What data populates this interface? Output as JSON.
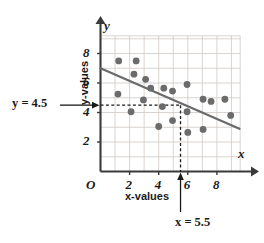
{
  "chart_data": {
    "type": "scatter",
    "title": "",
    "xlabel": "x-values",
    "ylabel": "y-values",
    "axis_letter_x": "x",
    "axis_letter_y": "y",
    "origin_label": "O",
    "xlim": [
      0,
      9.6
    ],
    "ylim": [
      0,
      9.2
    ],
    "xticks": [
      2,
      4,
      6,
      8
    ],
    "yticks": [
      2,
      4,
      6,
      8
    ],
    "xtick_labels": [
      "2",
      "4",
      "6",
      "8"
    ],
    "ytick_labels": [
      "2",
      "4",
      "6",
      "8"
    ],
    "grid": true,
    "grid_step": 1,
    "legend": "none",
    "points": [
      {
        "x": 1.25,
        "y": 7.5
      },
      {
        "x": 2.45,
        "y": 7.5
      },
      {
        "x": 2.3,
        "y": 6.6
      },
      {
        "x": 3.1,
        "y": 6.25
      },
      {
        "x": 1.2,
        "y": 5.25
      },
      {
        "x": 3.45,
        "y": 5.65
      },
      {
        "x": 4.35,
        "y": 5.65
      },
      {
        "x": 4.95,
        "y": 5.45
      },
      {
        "x": 5.95,
        "y": 5.9
      },
      {
        "x": 2.95,
        "y": 4.85
      },
      {
        "x": 4.25,
        "y": 4.4
      },
      {
        "x": 7.05,
        "y": 4.9
      },
      {
        "x": 7.6,
        "y": 4.75
      },
      {
        "x": 8.55,
        "y": 4.9
      },
      {
        "x": 2.1,
        "y": 4.05
      },
      {
        "x": 5.95,
        "y": 4.05
      },
      {
        "x": 8.95,
        "y": 3.8
      },
      {
        "x": 4.95,
        "y": 3.45
      },
      {
        "x": 4.0,
        "y": 3.05
      },
      {
        "x": 6.0,
        "y": 2.65
      },
      {
        "x": 7.05,
        "y": 2.85
      }
    ],
    "trend_line": {
      "name": "line of best fit",
      "x0": 0.0,
      "y0": 7.0,
      "x1": 9.55,
      "y1": 2.9,
      "color": "#6b6b6b"
    },
    "annotations": [
      {
        "name": "y-reference",
        "label": "y = 4.5",
        "value": 4.5,
        "orientation": "horizontal",
        "style": "dashed"
      },
      {
        "name": "x-reference",
        "label": "x = 5.5",
        "value": 5.5,
        "orientation": "vertical",
        "style": "dashed"
      }
    ],
    "colors": {
      "point": "#6b6b6b",
      "grid": "#cfc9c4",
      "axis": "#3a3a3a",
      "dashed": "#1a1a1a"
    }
  }
}
